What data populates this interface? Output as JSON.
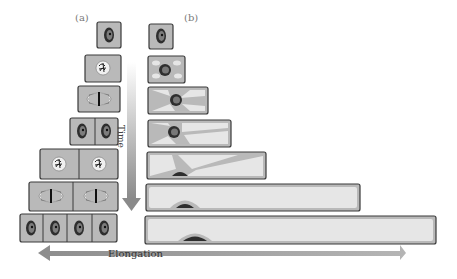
{
  "panel_labels": {
    "a": "(a)",
    "b": "(b)"
  },
  "axes": {
    "vertical": "Time",
    "horizontal": "Elongation"
  },
  "colors": {
    "cell_fill": "#b9b9b9",
    "cell_border": "#3a3a3a",
    "vacuole": "#e6e6e6",
    "nucleus": "#2e2e2e",
    "arrow": "#9a9a9a"
  },
  "column_a": {
    "title": "Cell division",
    "rows": [
      {
        "stage": "single cell, interphase",
        "cells": 1
      },
      {
        "stage": "prophase",
        "cells": 1
      },
      {
        "stage": "metaphase",
        "cells": 1
      },
      {
        "stage": "two daughter cells",
        "cells": 2
      },
      {
        "stage": "prophase (two cells)",
        "cells": 2
      },
      {
        "stage": "metaphase (two cells)",
        "cells": 2
      },
      {
        "stage": "four daughter cells",
        "cells": 4
      }
    ]
  },
  "column_b": {
    "title": "Cell elongation",
    "rows": [
      {
        "stage": "small cell"
      },
      {
        "stage": "small vacuoles forming"
      },
      {
        "stage": "vacuoles enlarge"
      },
      {
        "stage": "vacuoles merge"
      },
      {
        "stage": "nucleus pushed to wall"
      },
      {
        "stage": "large central vacuole"
      },
      {
        "stage": "fully elongated cell"
      }
    ]
  }
}
